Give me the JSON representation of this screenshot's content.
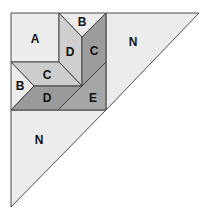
{
  "diagram": {
    "colors": {
      "light": "#ececec",
      "lighter": "#f0f0f0",
      "medium_light": "#cfcfcf",
      "medium": "#bdbdbd",
      "dark": "#9a9a9a",
      "darker": "#8c8c8c",
      "outline": "#3a3a3a"
    },
    "pieces": [
      {
        "id": "A",
        "label": "A"
      },
      {
        "id": "B-top",
        "label": "B"
      },
      {
        "id": "D-vertical",
        "label": "D"
      },
      {
        "id": "C-vertical",
        "label": "C"
      },
      {
        "id": "N-right",
        "label": "N"
      },
      {
        "id": "C-horizontal",
        "label": "C"
      },
      {
        "id": "B-left",
        "label": "B"
      },
      {
        "id": "D-horizontal",
        "label": "D"
      },
      {
        "id": "E",
        "label": "E"
      },
      {
        "id": "N-bottom",
        "label": "N"
      }
    ]
  }
}
